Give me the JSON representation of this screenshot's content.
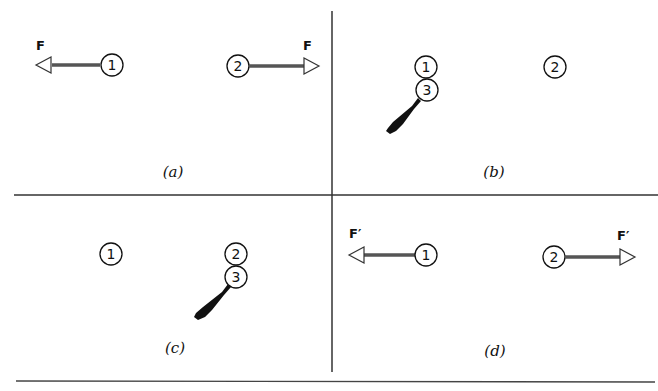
{
  "figure": {
    "panels": [
      {
        "id": "a",
        "caption": "(a)",
        "nodes": [
          {
            "label": "1"
          },
          {
            "label": "2"
          }
        ],
        "forces": [
          {
            "label": "F",
            "direction": "left",
            "on": "1"
          },
          {
            "label": "F",
            "direction": "right",
            "on": "2"
          }
        ]
      },
      {
        "id": "b",
        "caption": "(b)",
        "nodes": [
          {
            "label": "1"
          },
          {
            "label": "3"
          },
          {
            "label": "2"
          }
        ],
        "probe": {
          "attached_to": "3",
          "near": "1"
        }
      },
      {
        "id": "c",
        "caption": "(c)",
        "nodes": [
          {
            "label": "1"
          },
          {
            "label": "2"
          },
          {
            "label": "3"
          }
        ],
        "probe": {
          "attached_to": "3",
          "near": "2"
        }
      },
      {
        "id": "d",
        "caption": "(d)",
        "nodes": [
          {
            "label": "1"
          },
          {
            "label": "2"
          }
        ],
        "forces": [
          {
            "label": "F′",
            "direction": "left",
            "on": "1"
          },
          {
            "label": "F′",
            "direction": "right",
            "on": "2"
          }
        ]
      }
    ],
    "colors": {
      "ink": "#111111",
      "arrow_shaft": "#555555",
      "background": "#ffffff"
    }
  }
}
